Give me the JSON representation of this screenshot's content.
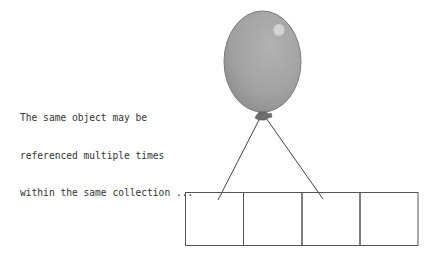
{
  "caption": {
    "lines": [
      "The same object may be",
      "referenced multiple times",
      "within the same collection ..."
    ]
  },
  "balloon": {
    "name": "balloon-object",
    "fill": "#a3a3a3",
    "stroke": "#7a7a7a",
    "highlight": "#d6d6d6"
  },
  "collection": {
    "name": "collection-array",
    "slot_count": 4,
    "referenced_slots": [
      0,
      2
    ],
    "stroke": "#555555"
  }
}
